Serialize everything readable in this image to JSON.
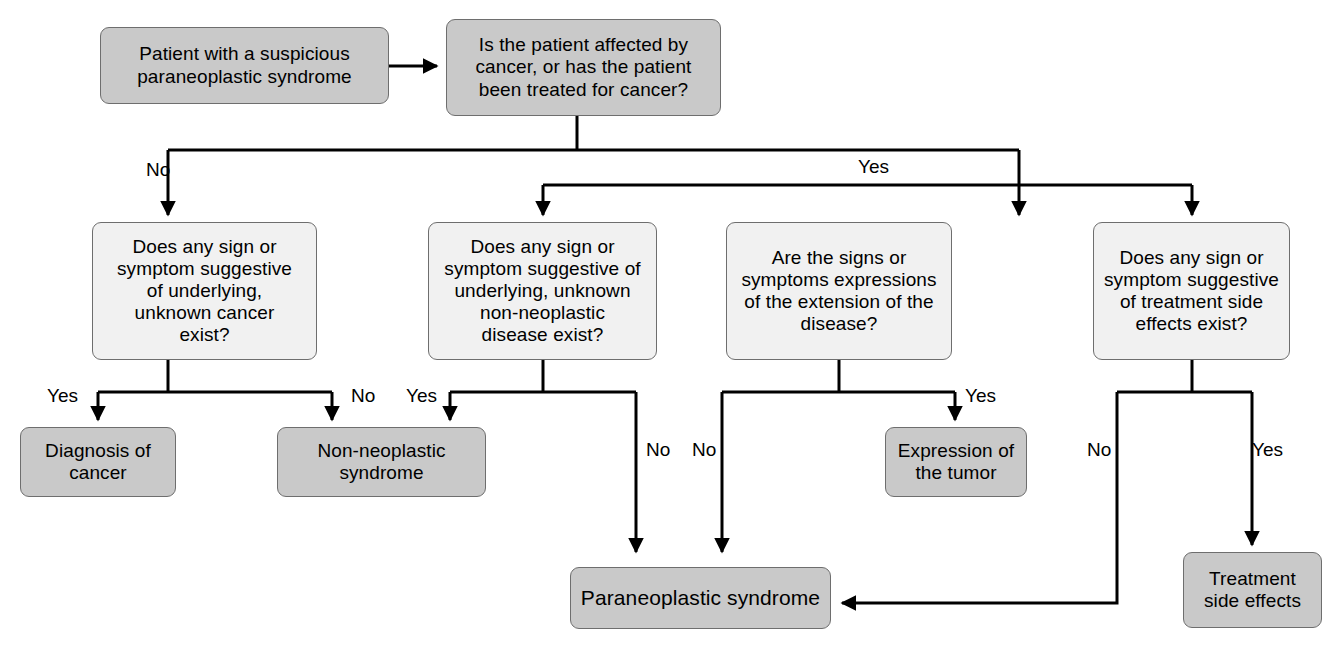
{
  "diagram": {
    "style": {
      "shaded_fill": "#c9c9c9",
      "plain_fill": "#f1f1f1",
      "stroke": "#6e6e6e",
      "line_color": "#000000",
      "text_color": "#000000",
      "background": "#ffffff"
    },
    "nodes": [
      {
        "id": "start",
        "text": "Patient with a suspicious\nparaneoplastic syndrome",
        "fill": "shaded",
        "font_size": 19,
        "x": 100,
        "y": 27,
        "w": 289,
        "h": 77
      },
      {
        "id": "q-cancer",
        "text": "Is the patient affected by\ncancer, or has the patient\nbeen treated for cancer?",
        "fill": "shaded",
        "font_size": 19,
        "x": 446,
        "y": 19,
        "w": 275,
        "h": 97
      },
      {
        "id": "q-unknown-cancer",
        "text": "Does any sign or\nsymptom suggestive\nof underlying,\nunknown cancer\nexist?",
        "fill": "plain",
        "font_size": 19,
        "x": 92,
        "y": 222,
        "w": 225,
        "h": 138
      },
      {
        "id": "q-non-neoplastic",
        "text": "Does any sign or\nsymptom suggestive of\nunderlying, unknown\nnon-neoplastic\ndisease exist?",
        "fill": "plain",
        "font_size": 19,
        "x": 428,
        "y": 222,
        "w": 229,
        "h": 138
      },
      {
        "id": "q-extension",
        "text": "Are the signs or\nsymptoms expressions\nof the extension of the\ndisease?",
        "fill": "plain",
        "font_size": 19,
        "x": 726,
        "y": 222,
        "w": 226,
        "h": 138
      },
      {
        "id": "q-side-effects",
        "text": "Does any sign or\nsymptom suggestive\nof treatment side\neffects exist?",
        "fill": "plain",
        "font_size": 19,
        "x": 1093,
        "y": 222,
        "w": 197,
        "h": 138
      },
      {
        "id": "diagnosis-cancer",
        "text": "Diagnosis of\ncancer",
        "fill": "shaded",
        "font_size": 19,
        "x": 20,
        "y": 427,
        "w": 156,
        "h": 70
      },
      {
        "id": "non-neoplastic-syndrome",
        "text": "Non-neoplastic\nsyndrome",
        "fill": "shaded",
        "font_size": 19,
        "x": 277,
        "y": 427,
        "w": 209,
        "h": 70
      },
      {
        "id": "expression-tumor",
        "text": "Expression of\nthe tumor",
        "fill": "shaded",
        "font_size": 19,
        "x": 885,
        "y": 427,
        "w": 142,
        "h": 70
      },
      {
        "id": "treatment-side-effects",
        "text": "Treatment\nside effects",
        "fill": "shaded",
        "font_size": 19,
        "x": 1183,
        "y": 552,
        "w": 139,
        "h": 76
      },
      {
        "id": "paraneoplastic-syndrome",
        "text": "Paraneoplastic syndrome",
        "fill": "shaded",
        "font_size": 21,
        "x": 570,
        "y": 567,
        "w": 261,
        "h": 62
      }
    ],
    "edges": [
      {
        "id": "start-to-question",
        "from": "start",
        "to": "q-cancer",
        "label": ""
      },
      {
        "id": "cancer-no",
        "from": "q-cancer",
        "to": "q-unknown-cancer",
        "label": "No"
      },
      {
        "id": "cancer-yes",
        "from": "q-cancer",
        "to": "branch-bus",
        "label": "Yes"
      },
      {
        "id": "bus-to-non-neoplastic",
        "from": "branch-bus",
        "to": "q-non-neoplastic",
        "label": ""
      },
      {
        "id": "bus-to-extension",
        "from": "branch-bus",
        "to": "q-extension",
        "label": ""
      },
      {
        "id": "bus-to-side-effects",
        "from": "branch-bus",
        "to": "q-side-effects",
        "label": ""
      },
      {
        "id": "unknown-cancer-yes",
        "from": "q-unknown-cancer",
        "to": "diagnosis-cancer",
        "label": "Yes"
      },
      {
        "id": "unknown-cancer-no",
        "from": "q-unknown-cancer",
        "to": "non-neoplastic-syndrome",
        "label": "No"
      },
      {
        "id": "non-neoplastic-yes",
        "from": "q-non-neoplastic",
        "to": "non-neoplastic-syndrome",
        "label": "Yes"
      },
      {
        "id": "non-neoplastic-no",
        "from": "q-non-neoplastic",
        "to": "paraneoplastic-syndrome",
        "label": "No"
      },
      {
        "id": "extension-no",
        "from": "q-extension",
        "to": "paraneoplastic-syndrome",
        "label": "No"
      },
      {
        "id": "extension-yes",
        "from": "q-extension",
        "to": "expression-tumor",
        "label": "Yes"
      },
      {
        "id": "side-effects-no",
        "from": "q-side-effects",
        "to": "paraneoplastic-syndrome",
        "label": "No"
      },
      {
        "id": "side-effects-yes",
        "from": "q-side-effects",
        "to": "treatment-side-effects",
        "label": "Yes"
      }
    ],
    "edge_labels": [
      {
        "id": "label-cancer-no",
        "text": "No",
        "x": 146,
        "y": 160
      },
      {
        "id": "label-cancer-yes",
        "text": "Yes",
        "x": 858,
        "y": 157
      },
      {
        "id": "label-unknown-yes",
        "text": "Yes",
        "x": 47,
        "y": 386
      },
      {
        "id": "label-unknown-no",
        "text": "No",
        "x": 351,
        "y": 386
      },
      {
        "id": "label-nonneo-yes",
        "text": "Yes",
        "x": 406,
        "y": 386
      },
      {
        "id": "label-nonneo-no",
        "text": "No",
        "x": 646,
        "y": 440
      },
      {
        "id": "label-extension-no",
        "text": "No",
        "x": 692,
        "y": 440
      },
      {
        "id": "label-extension-yes",
        "text": "Yes",
        "x": 965,
        "y": 386
      },
      {
        "id": "label-sideeffects-no",
        "text": "No",
        "x": 1087,
        "y": 440
      },
      {
        "id": "label-sideeffects-yes",
        "text": "Yes",
        "x": 1252,
        "y": 440
      }
    ]
  }
}
